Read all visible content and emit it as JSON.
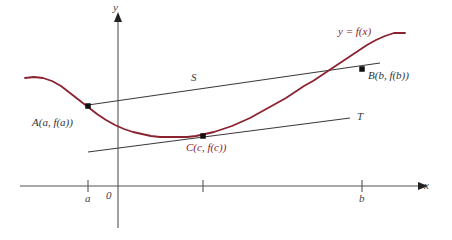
{
  "figure": {
    "width": 452,
    "height": 240,
    "background": "#ffffff"
  },
  "colors": {
    "curve": "#8b2230",
    "axis": "#555555",
    "line": "#3a3a3a",
    "point": "#111111",
    "label_dark": "#333333"
  },
  "axes": {
    "x_label": "x",
    "y_label": "y",
    "origin_label": "0",
    "x_axis": {
      "x1": 20,
      "x2": 424,
      "y": 186
    },
    "y_axis": {
      "x": 118,
      "y1": 14,
      "y2": 228
    },
    "ticks": [
      {
        "label": "a",
        "x": 88
      },
      {
        "label": "",
        "x": 203
      },
      {
        "label": "b",
        "x": 362
      }
    ]
  },
  "curve": {
    "label": "y = f(x)",
    "label_x": 338,
    "label_y": 26,
    "color": "#8b2230",
    "points": [
      [
        25,
        78
      ],
      [
        34,
        77
      ],
      [
        43,
        78
      ],
      [
        52,
        81
      ],
      [
        61,
        86
      ],
      [
        70,
        93
      ],
      [
        79,
        100
      ],
      [
        88,
        107
      ],
      [
        97,
        114
      ],
      [
        106,
        120
      ],
      [
        115,
        125
      ],
      [
        124,
        129
      ],
      [
        133,
        132
      ],
      [
        142,
        134
      ],
      [
        151,
        136
      ],
      [
        160,
        137
      ],
      [
        169,
        137
      ],
      [
        178,
        137
      ],
      [
        187,
        137
      ],
      [
        196,
        136
      ],
      [
        205,
        134
      ],
      [
        214,
        132
      ],
      [
        223,
        129
      ],
      [
        232,
        126
      ],
      [
        241,
        122
      ],
      [
        250,
        118
      ],
      [
        259,
        113
      ],
      [
        268,
        108
      ],
      [
        277,
        103
      ],
      [
        286,
        98
      ],
      [
        295,
        92
      ],
      [
        304,
        86
      ],
      [
        313,
        81
      ],
      [
        322,
        75
      ],
      [
        331,
        69
      ],
      [
        340,
        63
      ],
      [
        349,
        57
      ],
      [
        358,
        51
      ],
      [
        367,
        45
      ],
      [
        376,
        40
      ],
      [
        385,
        36
      ],
      [
        394,
        33
      ],
      [
        405,
        33
      ]
    ]
  },
  "secant": {
    "name": "S",
    "label": "S",
    "label_x": 191,
    "label_y": 72,
    "x1": 88,
    "y1": 105,
    "x2": 380,
    "y2": 63
  },
  "tangent": {
    "name": "T",
    "label": "T",
    "label_x": 357,
    "label_y": 111,
    "x1": 88,
    "y1": 152,
    "x2": 350,
    "y2": 118
  },
  "points": [
    {
      "id": "A",
      "label": "A(a, f(a))",
      "x": 88,
      "y": 106,
      "label_x": 32,
      "label_y": 117,
      "color": "#333333"
    },
    {
      "id": "B",
      "label": "B(b, f(b))",
      "x": 362,
      "y": 69,
      "label_x": 368,
      "label_y": 70,
      "color": "#333333"
    },
    {
      "id": "C",
      "label": "C(c, f(c))",
      "x": 203,
      "y": 136,
      "label_x": 186,
      "label_y": 142,
      "color": "#8b2230"
    }
  ]
}
